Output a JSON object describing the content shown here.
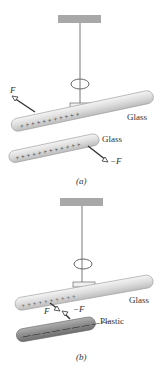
{
  "panels": [
    {
      "caption": "(a)",
      "top_rod_material": "Glass",
      "bottom_rod_material": "Glass",
      "force_top": "F",
      "force_bottom": "−F",
      "top_rod_charge": "+",
      "bottom_rod_charge": "+"
    },
    {
      "caption": "(b)",
      "top_rod_material": "Glass",
      "bottom_rod_material": "Plastic",
      "force_top": "F",
      "force_bottom": "−F",
      "top_rod_charge": "+",
      "bottom_rod_charge": "−"
    }
  ],
  "colors": {
    "rod_glass": "#d9d9d9",
    "rod_plastic": "#9a9a9a",
    "support": "#a8a8a8",
    "arrow": "#333333"
  }
}
